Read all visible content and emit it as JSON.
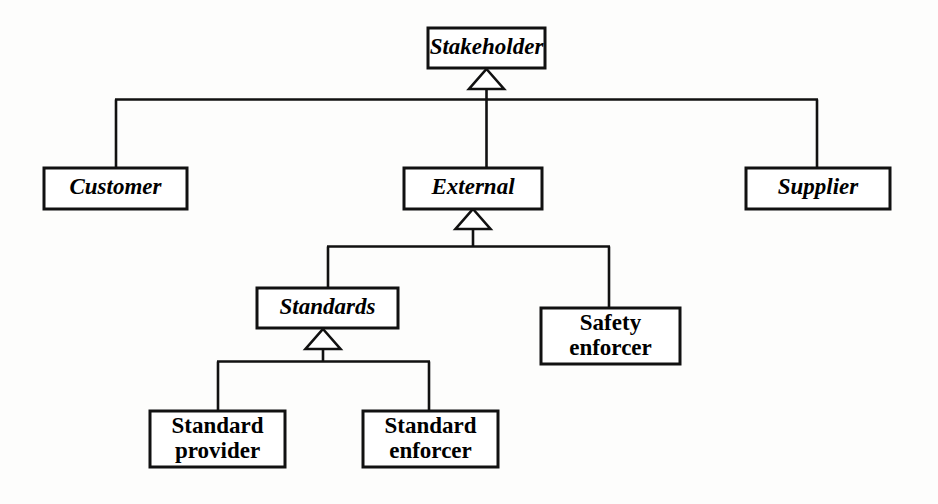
{
  "diagram": {
    "type": "uml-class-diagram",
    "notation": "UML generalization (inheritance) hierarchy",
    "background_color": "#fdfdfc",
    "line_color": "#111111",
    "box_fill": "#ffffff",
    "classes": [
      {
        "id": "stakeholder",
        "label": "Stakeholder",
        "abstract": true,
        "lines": [
          "Stakeholder"
        ],
        "x": 428,
        "y": 28,
        "w": 117,
        "h": 40
      },
      {
        "id": "customer",
        "label": "Customer",
        "abstract": true,
        "lines": [
          "Customer"
        ],
        "x": 44,
        "y": 168,
        "w": 143,
        "h": 41
      },
      {
        "id": "external",
        "label": "External",
        "abstract": true,
        "lines": [
          "External"
        ],
        "x": 404,
        "y": 168,
        "w": 138,
        "h": 41
      },
      {
        "id": "supplier",
        "label": "Supplier",
        "abstract": true,
        "lines": [
          "Supplier"
        ],
        "x": 746,
        "y": 168,
        "w": 144,
        "h": 41
      },
      {
        "id": "standards",
        "label": "Standards",
        "abstract": true,
        "lines": [
          "Standards"
        ],
        "x": 257,
        "y": 288,
        "w": 141,
        "h": 40
      },
      {
        "id": "safety-enforcer",
        "label": "Safety enforcer",
        "abstract": false,
        "lines": [
          "Safety",
          "enforcer"
        ],
        "x": 541,
        "y": 308,
        "w": 139,
        "h": 56
      },
      {
        "id": "standard-provider",
        "label": "Standard provider",
        "abstract": false,
        "lines": [
          "Standard",
          "provider"
        ],
        "x": 150,
        "y": 411,
        "w": 135,
        "h": 56
      },
      {
        "id": "standard-enforcer",
        "label": "Standard enforcer",
        "abstract": false,
        "lines": [
          "Standard",
          "enforcer"
        ],
        "x": 363,
        "y": 411,
        "w": 135,
        "h": 56
      }
    ],
    "generalizations": [
      {
        "id": "gen-stakeholder",
        "parent": "stakeholder",
        "children": [
          "customer",
          "external",
          "supplier"
        ]
      },
      {
        "id": "gen-external",
        "parent": "external",
        "children": [
          "standards",
          "safety-enforcer"
        ]
      },
      {
        "id": "gen-standards",
        "parent": "standards",
        "children": [
          "standard-provider",
          "standard-enforcer"
        ]
      }
    ]
  }
}
